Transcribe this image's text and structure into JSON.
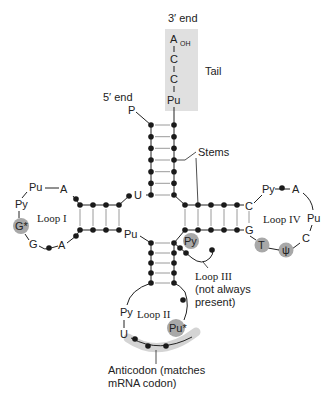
{
  "diagram": {
    "title_visible": "",
    "labels": {
      "three_prime_end": "3′ end",
      "five_prime_end": "5′ end",
      "phosphate": "P",
      "tail": "Tail",
      "stems": "Stems",
      "loop1": "Loop I",
      "loop2": "Loop II",
      "loop3_line1": "Loop III",
      "loop3_line2": "(not always",
      "loop3_line3": "present)",
      "loop4": "Loop IV",
      "anticodon_line1": "Anticodon (matches",
      "anticodon_line2": "mRNA codon)"
    },
    "tail": {
      "nucleotides": [
        "A",
        "C",
        "C",
        "Pu"
      ],
      "oh": "OH",
      "box_color": "#e0e0e0"
    },
    "acceptor_stem": {
      "junction_base": "U"
    },
    "d_arm": {
      "junction_base": "Pu",
      "loop_bases": {
        "pu": "Pu",
        "a_top": "A",
        "py": "Py",
        "g_star": "G*",
        "g": "G",
        "a_bottom": "A"
      }
    },
    "t_arm": {
      "stem_top_base": "C",
      "stem_bottom_base": "G",
      "loop_bases": {
        "py": "Py",
        "a": "A",
        "pu": "Pu",
        "c": "C",
        "psi": "ψ",
        "t": "T"
      }
    },
    "variable_loop": {
      "base": "Py"
    },
    "anticodon_arm": {
      "loop_bases": {
        "py": "Py",
        "u": "U",
        "pu_star": "Pu*"
      }
    },
    "colors": {
      "line": "#222222",
      "dot": "#1a1a1a",
      "pair_line": "#9a9a9a",
      "highlight": "#a8a8a8",
      "tail_bg": "#e0e0e0",
      "anticodon_band": "#d4d4d4"
    }
  }
}
